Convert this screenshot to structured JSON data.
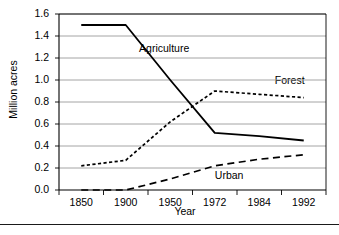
{
  "chart_data": {
    "type": "line",
    "title": "",
    "xlabel": "Year",
    "ylabel": "Million acres",
    "categories": [
      "1850",
      "1900",
      "1950",
      "1972",
      "1984",
      "1992"
    ],
    "ylim": [
      0.0,
      1.6
    ],
    "ytick_labels": [
      "0.0",
      "0.2",
      "0.4",
      "0.6",
      "0.8",
      "1.0",
      "1.2",
      "1.4",
      "1.6"
    ],
    "ytick_values": [
      0.0,
      0.2,
      0.4,
      0.6,
      0.8,
      1.0,
      1.2,
      1.4,
      1.6
    ],
    "grid": "horizontal",
    "legend": "inline-annotations",
    "series": [
      {
        "name": "Agriculture",
        "style": "solid",
        "color": "#000000",
        "values": [
          1.5,
          1.5,
          1.0,
          0.52,
          0.49,
          0.45
        ],
        "label_x": 1.3,
        "label_y": 1.28
      },
      {
        "name": "Forest",
        "style": "dotted",
        "color": "#000000",
        "values": [
          0.22,
          0.27,
          0.62,
          0.9,
          0.87,
          0.84
        ],
        "label_x": 4.35,
        "label_y": 0.99
      },
      {
        "name": "Urban",
        "style": "dashed",
        "color": "#000000",
        "values": [
          0.0,
          0.0,
          0.1,
          0.22,
          0.28,
          0.32
        ],
        "label_x": 3.0,
        "label_y": 0.13
      }
    ]
  }
}
